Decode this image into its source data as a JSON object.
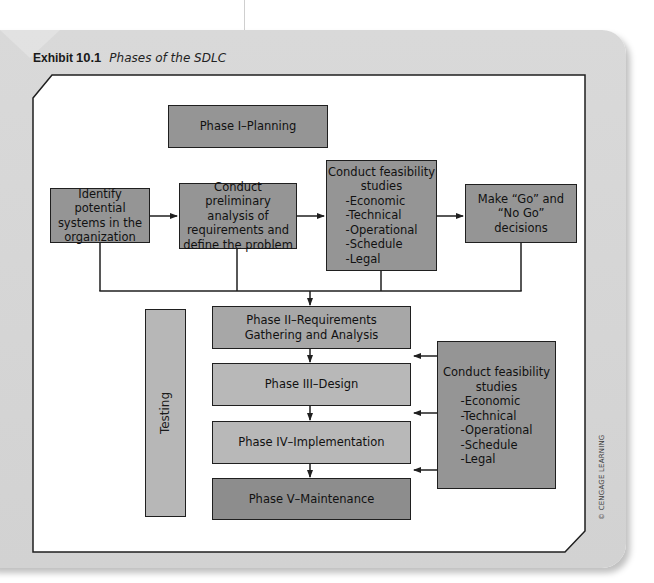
{
  "exhibit": {
    "label": "Exhibit",
    "number": "10.1",
    "caption": "Phases of the SDLC"
  },
  "planning": {
    "header": "Phase I–Planning",
    "steps": [
      {
        "id": "identify",
        "text": "Identify potential systems in the organization"
      },
      {
        "id": "preliminary",
        "text": "Conduct preliminary analysis of requirements and define the problem"
      },
      {
        "id": "feasibility",
        "title": "Conduct feasibility studies",
        "items": [
          "-Economic",
          "-Technical",
          "-Operational",
          "-Schedule",
          "-Legal"
        ]
      },
      {
        "id": "decision",
        "text": "Make “Go” and “No Go” decisions"
      }
    ]
  },
  "phases": [
    {
      "label": "Phase II–Requirements Gathering and Analysis"
    },
    {
      "label": "Phase III–Design"
    },
    {
      "label": "Phase IV–Implementation"
    },
    {
      "label": "Phase V–Maintenance"
    }
  ],
  "testing": {
    "label": "Testing"
  },
  "side_feasibility": {
    "title": "Conduct feasibility studies",
    "items": [
      "-Economic",
      "-Technical",
      "-Operational",
      "-Schedule",
      "-Legal"
    ]
  },
  "credit": "© CENGAGE LEARNING",
  "colors": {
    "card": "#d5d5d5",
    "box_dark": "#959595",
    "box_mid": "#a7a7a7",
    "box_light": "#b8b8b8",
    "line": "#1f1f1f"
  }
}
